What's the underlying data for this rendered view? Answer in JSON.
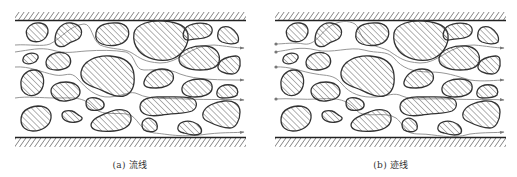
{
  "figure": {
    "panels": [
      {
        "id": "a",
        "caption": "(a) 流线",
        "label": "a",
        "title": "流线",
        "meaning": "streamlines",
        "inlet_markers": false
      },
      {
        "id": "b",
        "caption": "(b) 迹线",
        "label": "b",
        "title": "迹线",
        "meaning": "pathlines",
        "inlet_markers": true
      }
    ],
    "colors": {
      "background": "#ffffff",
      "grain_outline": "#333333",
      "hatch": "#555555",
      "wall": "#222222",
      "flow_line": "#888888"
    },
    "icons": {
      "flow_arrow": "arrowhead",
      "inlet_marker": "dot"
    }
  }
}
